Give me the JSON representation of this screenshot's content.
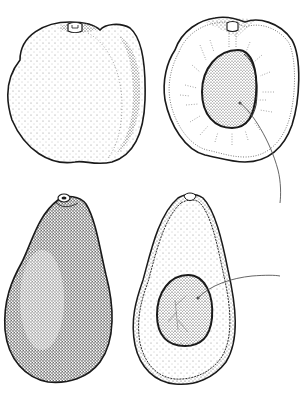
{
  "illustration": {
    "subject": "Botanical line drawing of apricot and avocado fruits",
    "colors": {
      "ink": "#1a1a1a",
      "stipple": "#555555",
      "paper": "#ffffff"
    },
    "figures": [
      {
        "name": "apricot-whole",
        "view": "exterior"
      },
      {
        "name": "apricot-half",
        "view": "cross-section",
        "has_leader_line": true
      },
      {
        "name": "avocado-whole",
        "view": "exterior"
      },
      {
        "name": "avocado-half",
        "view": "cross-section",
        "has_leader_line": true
      }
    ],
    "labels": []
  }
}
